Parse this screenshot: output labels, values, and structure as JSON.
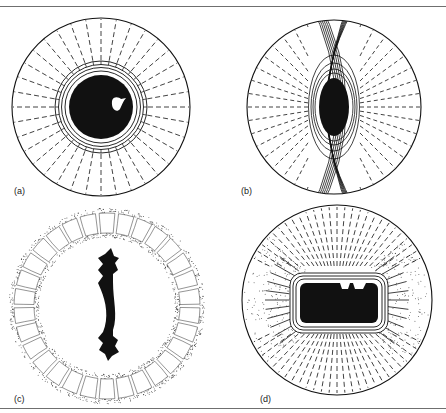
{
  "figure": {
    "panels": [
      {
        "id": "a",
        "label": "(a)",
        "label_pos": [
          14,
          186
        ],
        "description": "Spherical cell with central nucleus, concentric rings and dashed radial lines",
        "center": [
          101,
          107
        ],
        "outer_radius": 89,
        "nucleus_radius": 32,
        "ring_radii": [
          36,
          39.5,
          42.5,
          46
        ],
        "radial_count": 36,
        "blob": [
          117,
          104
        ]
      },
      {
        "id": "b",
        "label": "(b)",
        "label_pos": [
          241,
          186
        ],
        "description": "Spherical cell with elliptical nucleus, lens-shaped crossing lines and dashed radial lines",
        "center": [
          334,
          107
        ],
        "outer_radius": 87,
        "nucleus_rx": 15,
        "nucleus_ry": 29,
        "lens_count": 6,
        "radial_count": 40
      },
      {
        "id": "c",
        "label": "(c)",
        "label_pos": [
          14,
          394
        ],
        "description": "Ring of cells with stippled walls surrounding a central black chromosome-like shape",
        "center": [
          107,
          306
        ],
        "outer_radius": 96,
        "inner_radius": 70,
        "cell_count": 30
      },
      {
        "id": "d",
        "label": "(d)",
        "label_pos": [
          260,
          394
        ],
        "description": "Spherical cell with rounded-rectangle nucleus, outlined layers and radial lines, stippled sides",
        "center": [
          337,
          300
        ],
        "outer_radius": 95,
        "nucleus_rect": [
          300,
          283,
          78,
          40
        ]
      }
    ]
  },
  "colors": {
    "ink": "#111111",
    "rule": "#6f6f6f",
    "background": "#ffffff"
  }
}
